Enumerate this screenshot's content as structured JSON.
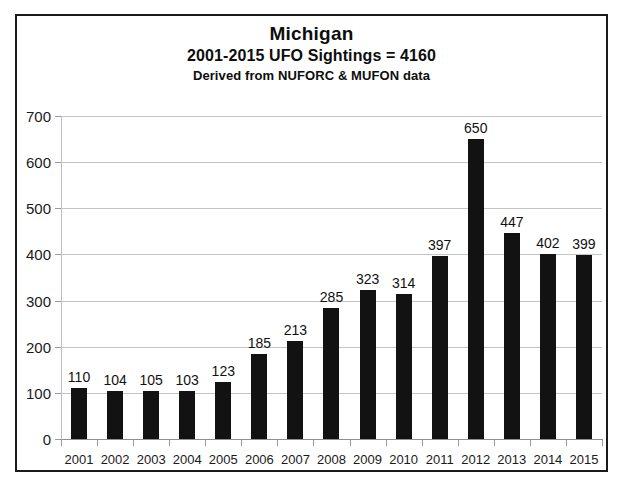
{
  "chart_data": {
    "type": "bar",
    "title": "Michigan",
    "subtitle": "2001-2015  UFO Sightings = 4160",
    "source_note": "Derived from NUFORC & MUFON data",
    "xlabel": "",
    "ylabel": "",
    "ylim": [
      0,
      700
    ],
    "ytick_step": 100,
    "yticks": [
      0,
      100,
      200,
      300,
      400,
      500,
      600,
      700
    ],
    "ytick_labels": [
      "0",
      "100",
      "200",
      "300",
      "400",
      "500",
      "600",
      "700"
    ],
    "grid": true,
    "legend": "none",
    "bar_color": "#121212",
    "gridline_color": "#c4c4c4",
    "border_color": "#1a1a1a",
    "background": "#ffffff",
    "show_data_labels": true,
    "total": 4160,
    "categories": [
      "2001",
      "2002",
      "2003",
      "2004",
      "2005",
      "2006",
      "2007",
      "2008",
      "2009",
      "2010",
      "2011",
      "2012",
      "2013",
      "2014",
      "2015"
    ],
    "values": [
      110,
      104,
      105,
      103,
      123,
      185,
      213,
      285,
      323,
      314,
      397,
      650,
      447,
      402,
      399
    ],
    "points": [
      {
        "year": "2001",
        "value": 110
      },
      {
        "year": "2002",
        "value": 104
      },
      {
        "year": "2003",
        "value": 105
      },
      {
        "year": "2004",
        "value": 103
      },
      {
        "year": "2005",
        "value": 123
      },
      {
        "year": "2006",
        "value": 185
      },
      {
        "year": "2007",
        "value": 213
      },
      {
        "year": "2008",
        "value": 285
      },
      {
        "year": "2009",
        "value": 323
      },
      {
        "year": "2010",
        "value": 314
      },
      {
        "year": "2011",
        "value": 397
      },
      {
        "year": "2012",
        "value": 650
      },
      {
        "year": "2013",
        "value": 447
      },
      {
        "year": "2014",
        "value": 402
      },
      {
        "year": "2015",
        "value": 399
      }
    ]
  }
}
